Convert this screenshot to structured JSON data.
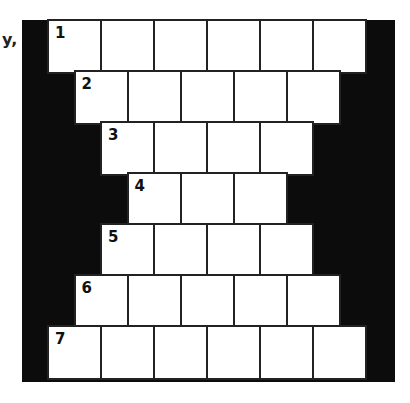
{
  "clipped_text": "y,",
  "puzzle": {
    "type": "pyramid-crossword",
    "cell_width_px": 53,
    "row_height_px": 51,
    "rows": [
      {
        "number": "1",
        "cells": 6,
        "offset_half_cells": 0
      },
      {
        "number": "2",
        "cells": 5,
        "offset_half_cells": 1
      },
      {
        "number": "3",
        "cells": 4,
        "offset_half_cells": 2
      },
      {
        "number": "4",
        "cells": 3,
        "offset_half_cells": 3
      },
      {
        "number": "5",
        "cells": 4,
        "offset_half_cells": 2
      },
      {
        "number": "6",
        "cells": 5,
        "offset_half_cells": 1
      },
      {
        "number": "7",
        "cells": 6,
        "offset_half_cells": 0
      }
    ]
  },
  "colors": {
    "background": "#0c0c0c",
    "cell": "#ffffff",
    "grid_line": "#222222"
  }
}
